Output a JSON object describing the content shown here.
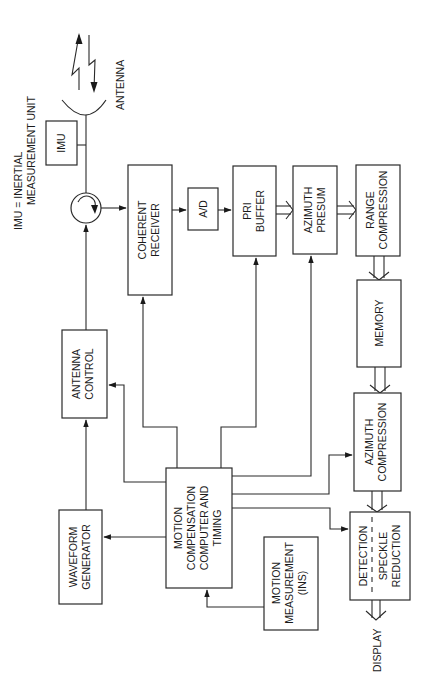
{
  "diagram": {
    "orientation": "rotated 90 degrees counter-clockwise",
    "legend": {
      "line1": "IMU = INERTIAL",
      "line2": "MEASUREMENT UNIT"
    },
    "antenna_label": "ANTENNA",
    "display_label": "DISPLAY",
    "blocks": {
      "imu": {
        "lines": [
          "IMU"
        ]
      },
      "coherent_receiver": {
        "lines": [
          "COHERENT",
          "RECEIVER"
        ]
      },
      "ad": {
        "lines": [
          "A/D"
        ]
      },
      "pri_buffer": {
        "lines": [
          "PRI",
          "BUFFER"
        ]
      },
      "azimuth_presum": {
        "lines": [
          "AZIMUTH",
          "PRESUM"
        ]
      },
      "range_compression": {
        "lines": [
          "RANGE",
          "COMPRESSION"
        ]
      },
      "memory": {
        "lines": [
          "MEMORY"
        ]
      },
      "azimuth_compression": {
        "lines": [
          "AZIMUTH",
          "COMPRESSION"
        ]
      },
      "detection": {
        "lines": [
          "DETECTION",
          "SPECKLE",
          "REDUCTION"
        ]
      },
      "antenna_control": {
        "lines": [
          "ANTENNA",
          "CONTROL"
        ]
      },
      "waveform_generator": {
        "lines": [
          "WAVEFORM",
          "GENERATOR"
        ]
      },
      "motion_comp": {
        "lines": [
          "MOTION",
          "COMPENSATION",
          "COMPUTER AND",
          "TIMING"
        ]
      },
      "motion_measurement": {
        "lines": [
          "MOTION",
          "MEASUREMENT",
          "(INS)"
        ]
      }
    },
    "colors": {
      "line": "#2a2a2a",
      "background": "#ffffff"
    }
  }
}
